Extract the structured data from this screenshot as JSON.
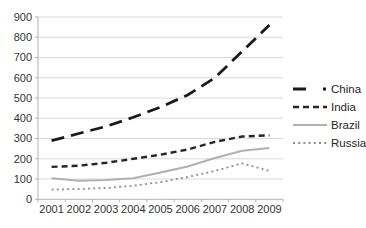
{
  "chart_data": {
    "type": "line",
    "title": "",
    "xlabel": "",
    "ylabel": "",
    "categories": [
      "2001",
      "2002",
      "2003",
      "2004",
      "2005",
      "2006",
      "2007",
      "2008",
      "2009"
    ],
    "ylim": [
      0,
      900
    ],
    "ytick_step": 100,
    "grid": "horizontal",
    "legend_position": "right",
    "series": [
      {
        "name": "China",
        "color": "#1a1a1a",
        "dash": "13 7",
        "width": 2.8,
        "legend_dash": "13 17 3 100",
        "values": [
          290,
          325,
          360,
          405,
          455,
          515,
          600,
          730,
          860
        ]
      },
      {
        "name": "India",
        "color": "#262626",
        "dash": "6 4",
        "width": 2.4,
        "legend_dash": "6 4",
        "values": [
          160,
          166,
          180,
          200,
          220,
          246,
          284,
          310,
          316
        ]
      },
      {
        "name": "Brazil",
        "color": "#b0b0b0",
        "dash": "",
        "width": 2.0,
        "legend_dash": "",
        "values": [
          104,
          92,
          96,
          104,
          132,
          162,
          204,
          240,
          254
        ]
      },
      {
        "name": "Russia",
        "color": "#8f8f8f",
        "dash": "2 3.2",
        "width": 1.8,
        "legend_dash": "2 3.2",
        "values": [
          48,
          51,
          56,
          67,
          85,
          110,
          140,
          177,
          140
        ]
      }
    ]
  },
  "colors": {
    "background": "#ffffff",
    "gridline": "#d9d9d9",
    "axis": "#b3b3b3",
    "tick_text": "#333333",
    "legend_text": "#262626"
  }
}
